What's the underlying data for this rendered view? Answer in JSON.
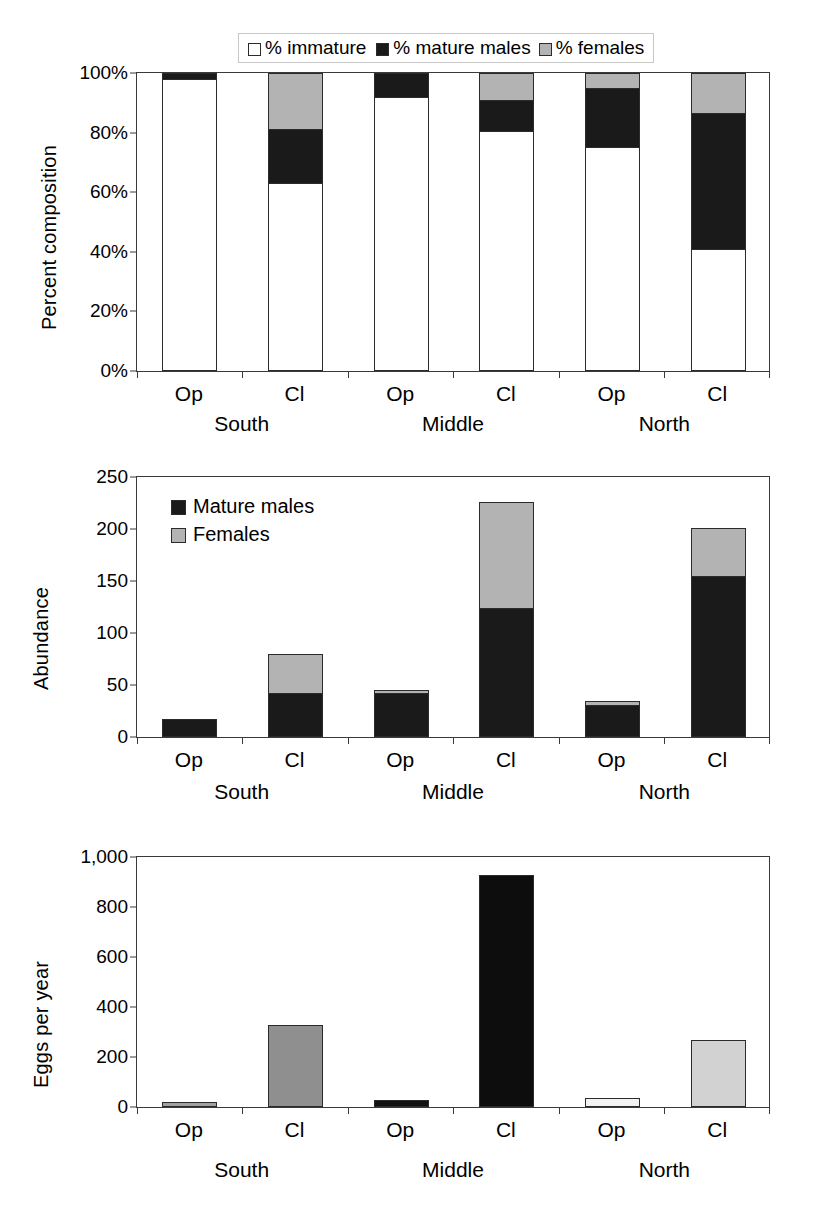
{
  "figure": {
    "groups": [
      "South",
      "Middle",
      "North"
    ],
    "treatments": [
      "Op",
      "Cl"
    ],
    "colors": {
      "immature": "#ffffff",
      "mature_males": "#1a1a1a",
      "females": "#b3b3b3",
      "outline": "#2b2b2b",
      "axis": "#3a3a3a",
      "eggs_south_op": "#a0a0a0",
      "eggs_south_cl": "#8f8f8f",
      "eggs_middle_op": "#111111",
      "eggs_middle_cl": "#0d0d0d",
      "eggs_north_op": "#f2f2f2",
      "eggs_north_cl": "#d2d2d2"
    }
  },
  "chart_data": [
    {
      "type": "bar",
      "id": "percent-composition",
      "title": "",
      "xlabel": "",
      "ylabel": "Percent composition",
      "ylim": [
        0,
        100
      ],
      "yticks": [
        "0%",
        "20%",
        "40%",
        "60%",
        "80%",
        "100%"
      ],
      "ytick_values": [
        0,
        20,
        40,
        60,
        80,
        100
      ],
      "grid": false,
      "stacked": true,
      "legend_position": "top-center",
      "legend": [
        "% immature",
        "% mature males",
        "% females"
      ],
      "categories": [
        "Op",
        "Cl",
        "Op",
        "Cl",
        "Op",
        "Cl"
      ],
      "group_labels": [
        "South",
        "Middle",
        "North"
      ],
      "series": [
        {
          "name": "% immature",
          "values": [
            98.0,
            63.0,
            92.0,
            80.5,
            75.0,
            40.5
          ]
        },
        {
          "name": "% mature males",
          "values": [
            2.0,
            18.0,
            8.0,
            10.5,
            20.0,
            46.0
          ]
        },
        {
          "name": "% females",
          "values": [
            0.0,
            19.0,
            0.0,
            9.0,
            5.0,
            13.5
          ]
        }
      ]
    },
    {
      "type": "bar",
      "id": "abundance",
      "title": "",
      "xlabel": "",
      "ylabel": "Abundance",
      "ylim": [
        0,
        250
      ],
      "yticks": [
        "0",
        "50",
        "100",
        "150",
        "200",
        "250"
      ],
      "ytick_values": [
        0,
        50,
        100,
        150,
        200,
        250
      ],
      "grid": false,
      "stacked": true,
      "legend_position": "inside-top-left",
      "legend": [
        "Mature males",
        "Females"
      ],
      "categories": [
        "Op",
        "Cl",
        "Op",
        "Cl",
        "Op",
        "Cl"
      ],
      "group_labels": [
        "South",
        "Middle",
        "North"
      ],
      "series": [
        {
          "name": "Mature males",
          "values": [
            17,
            41,
            42,
            123,
            31,
            154
          ]
        },
        {
          "name": "Females",
          "values": [
            0,
            39,
            3,
            103,
            4,
            47
          ]
        }
      ],
      "totals": [
        17,
        80,
        45,
        226,
        35,
        201
      ]
    },
    {
      "type": "bar",
      "id": "eggs-per-year",
      "title": "",
      "xlabel": "",
      "ylabel": "Eggs per year",
      "ylim": [
        0,
        1000
      ],
      "yticks": [
        "0",
        "200",
        "400",
        "600",
        "800",
        "1,000"
      ],
      "ytick_values": [
        0,
        200,
        400,
        600,
        800,
        1000
      ],
      "grid": false,
      "stacked": false,
      "legend_position": "none",
      "categories": [
        "Op",
        "Cl",
        "Op",
        "Cl",
        "Op",
        "Cl"
      ],
      "group_labels": [
        "South",
        "Middle",
        "North"
      ],
      "series": [
        {
          "name": "Eggs per year",
          "values": [
            22,
            330,
            30,
            930,
            38,
            270
          ]
        }
      ]
    }
  ],
  "panel1": {
    "ylabel": "Percent composition",
    "legend": [
      {
        "label": "% immature",
        "swatch": "white-square-icon"
      },
      {
        "label": "% mature males",
        "swatch": "black-square-icon"
      },
      {
        "label": "% females",
        "swatch": "grey-square-icon"
      }
    ],
    "yticks": [
      "100%",
      "80%",
      "60%",
      "40%",
      "20%",
      "0%"
    ],
    "xlabels": [
      "Op",
      "Cl",
      "Op",
      "Cl",
      "Op",
      "Cl"
    ],
    "grouplabels": [
      "South",
      "Middle",
      "North"
    ]
  },
  "panel2": {
    "ylabel": "Abundance",
    "legend": [
      {
        "label": "Mature males",
        "swatch": "black-square-icon"
      },
      {
        "label": "Females",
        "swatch": "grey-square-icon"
      }
    ],
    "yticks": [
      "250",
      "200",
      "150",
      "100",
      "50",
      "0"
    ],
    "xlabels": [
      "Op",
      "Cl",
      "Op",
      "Cl",
      "Op",
      "Cl"
    ],
    "grouplabels": [
      "South",
      "Middle",
      "North"
    ]
  },
  "panel3": {
    "ylabel": "Eggs per year",
    "yticks": [
      "1,000",
      "800",
      "600",
      "400",
      "200",
      "0"
    ],
    "xlabels": [
      "Op",
      "Cl",
      "Op",
      "Cl",
      "Op",
      "Cl"
    ],
    "grouplabels": [
      "South",
      "Middle",
      "North"
    ]
  }
}
